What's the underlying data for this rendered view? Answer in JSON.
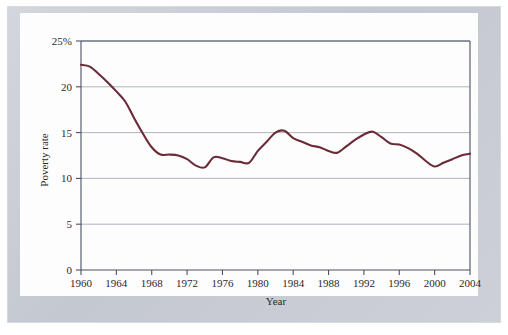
{
  "figure": {
    "frame_color": "#c9ccd4",
    "page_color": "#fdfdfd"
  },
  "chart_data": {
    "type": "line",
    "title": "",
    "xlabel": "Year",
    "ylabel": "Poverty rate",
    "xlim": [
      1960,
      2004
    ],
    "ylim": [
      0,
      25
    ],
    "grid": true,
    "legend_position": "none",
    "line_color": "#6b2b36",
    "axis_color": "#4b4f63",
    "grid_color": "#9aa0b8",
    "xticks": [
      1960,
      1964,
      1968,
      1972,
      1976,
      1980,
      1984,
      1988,
      1992,
      1996,
      2000,
      2004
    ],
    "xtick_labels": [
      "1960",
      "1964",
      "1968",
      "1972",
      "1976",
      "1980",
      "1984",
      "1988",
      "1992",
      "1996",
      "2000",
      "2004"
    ],
    "yticks": [
      0,
      5,
      10,
      15,
      20,
      25
    ],
    "ytick_labels": [
      "0",
      "5",
      "10",
      "15",
      "20",
      "25%"
    ],
    "series": [
      {
        "name": "Poverty rate",
        "x": [
          1960,
          1961,
          1962,
          1963,
          1964,
          1965,
          1966,
          1967,
          1968,
          1969,
          1970,
          1971,
          1972,
          1973,
          1974,
          1975,
          1976,
          1977,
          1978,
          1979,
          1980,
          1981,
          1982,
          1983,
          1984,
          1985,
          1986,
          1987,
          1988,
          1989,
          1990,
          1991,
          1992,
          1993,
          1994,
          1995,
          1996,
          1997,
          1998,
          1999,
          2000,
          2001,
          2002,
          2003,
          2004
        ],
        "values": [
          22.4,
          22.2,
          21.4,
          20.5,
          19.5,
          18.4,
          16.6,
          14.9,
          13.4,
          12.6,
          12.6,
          12.5,
          12.1,
          11.4,
          11.2,
          12.3,
          12.2,
          11.9,
          11.8,
          11.7,
          13.0,
          14.0,
          15.0,
          15.2,
          14.4,
          14.0,
          13.6,
          13.4,
          13.0,
          12.8,
          13.5,
          14.2,
          14.8,
          15.1,
          14.5,
          13.8,
          13.7,
          13.3,
          12.7,
          11.9,
          11.3,
          11.7,
          12.1,
          12.5,
          12.7
        ]
      }
    ]
  },
  "axis_labels": {
    "x_title": "Year",
    "y_title": "Poverty rate"
  }
}
